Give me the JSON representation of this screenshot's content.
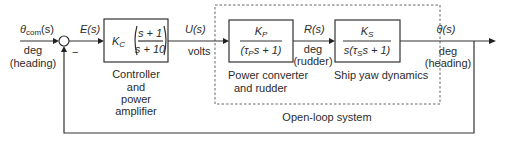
{
  "diagram": {
    "input": {
      "symbol": "θ",
      "subscript": "com",
      "suffix": "(s)",
      "unit": "deg",
      "note": "(heading)"
    },
    "summing_junction": {
      "feedback_sign": "−"
    },
    "error_signal": "E(s)",
    "controller": {
      "gain": "K",
      "gain_sub": "C",
      "numerator": "s + 1",
      "denominator": "s + 10",
      "caption": [
        "Controller",
        "and",
        "power",
        "amplifier"
      ]
    },
    "control_signal": {
      "label": "U(s)",
      "unit": "volts"
    },
    "power_converter": {
      "numerator": "K",
      "numerator_sub": "P",
      "denominator_pre": "(τ",
      "denominator_sub": "P",
      "denominator_post": "s + 1)",
      "caption": [
        "Power converter",
        "and rudder"
      ]
    },
    "rudder_signal": {
      "label": "R(s)",
      "unit": "deg",
      "note": "(rudder)"
    },
    "ship_yaw": {
      "numerator": "K",
      "numerator_sub": "S",
      "denominator_pre": "s(τ",
      "denominator_sub": "S",
      "denominator_post": "s + 1)",
      "caption": "Ship yaw dynamics"
    },
    "output": {
      "label": "θ(s)",
      "unit": "deg",
      "note": "(heading)"
    },
    "open_loop_label": "Open-loop system"
  }
}
